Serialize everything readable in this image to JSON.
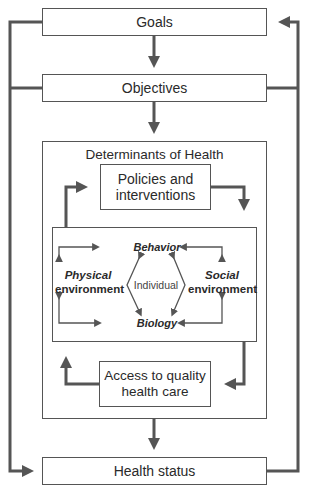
{
  "diagram": {
    "nodes": {
      "goals": "Goals",
      "objectives": "Objectives",
      "determinants_title": "Determinants of Health",
      "policies_line1": "Policies and",
      "policies_line2": "interventions",
      "behavior": "Behavior",
      "physical_line1": "Physical",
      "physical_line2": "environment",
      "individual": "Individual",
      "social_line1": "Social",
      "social_line2": "environment",
      "biology": "Biology",
      "access_line1": "Access to quality",
      "access_line2": "health care",
      "health_status": "Health status"
    },
    "colors": {
      "line": "#555555",
      "box_border": "#555555",
      "text": "#2a2a2a"
    }
  }
}
